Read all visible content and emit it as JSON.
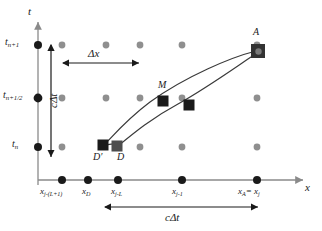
{
  "figure": {
    "kind": "space-time-characteristics-diagram",
    "axes": {
      "y_axis_label": "t",
      "x_axis_label": "x",
      "y_ticks": [
        {
          "id": "t_n",
          "base": "t",
          "sub": "n",
          "y": 158
        },
        {
          "id": "t_n_half",
          "base": "t",
          "sub": "n+1/2",
          "y": 98
        },
        {
          "id": "t_n_plus_1",
          "base": "t",
          "sub": "n+1",
          "y": 45
        }
      ],
      "x_ticks": [
        {
          "id": "x_j_L_1",
          "base": "x",
          "sub": "j-(L+1)",
          "x": 62
        },
        {
          "id": "x_D",
          "base": "x",
          "sub": "D",
          "x": 106
        },
        {
          "id": "x_j_L",
          "base": "x",
          "sub": "j-L",
          "x": 140
        },
        {
          "id": "x_j_1",
          "base": "x",
          "sub": "j-1",
          "x": 209
        },
        {
          "id": "x_A_j",
          "base": "x",
          "sub": "A",
          "eq": "= x",
          "sub2": "j",
          "x": 257
        }
      ]
    },
    "annotations": {
      "delta_x": "Δx",
      "c_delta_t_vertical": "cΔt",
      "c_delta_t_horizontal": "cΔt"
    },
    "points": [
      {
        "id": "D_prime",
        "label": "D′",
        "x": 103,
        "y": 145,
        "marker": "black-square"
      },
      {
        "id": "D",
        "label": "D",
        "x": 117,
        "y": 146,
        "marker": "gray-square"
      },
      {
        "id": "M",
        "label": "M",
        "x": 163,
        "y": 101,
        "marker": "black-square"
      },
      {
        "id": "A",
        "label": "A",
        "x": 258,
        "y": 51,
        "marker": "dark-square-dot"
      }
    ],
    "colors": {
      "axis": "#8a8a8a",
      "grid_dot": "#8f8f8f",
      "axis_dot": "#1a1a1a",
      "marker_black": "#1a1a1a",
      "marker_gray": "#4d4d4d",
      "characteristic_line": "#3a3a3a",
      "arrow": "#1a1a1a"
    },
    "grid": {
      "columns_x": [
        62,
        106,
        140,
        209,
        257,
        290
      ],
      "rows_y": [
        45,
        98,
        158
      ],
      "axis_row_y": 180
    }
  }
}
